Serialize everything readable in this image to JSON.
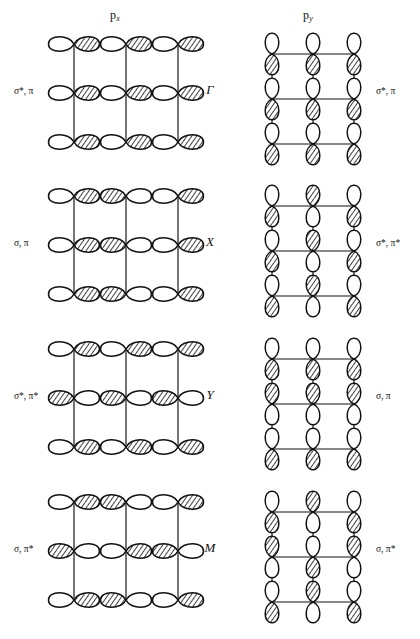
{
  "figure": {
    "headers": {
      "left": {
        "symbol": "p",
        "subscript": "x"
      },
      "right": {
        "symbol": "p",
        "subscript": "y"
      }
    },
    "rows": [
      {
        "kpoint": "Γ",
        "left_label": "σ*, π",
        "right_label": "σ*, π",
        "left_pattern": "uniform",
        "right_pattern": "uniform"
      },
      {
        "kpoint": "X",
        "left_label": "σ, π",
        "right_label": "σ*, π*",
        "left_pattern": "alternate-x",
        "right_pattern": "alternate-x"
      },
      {
        "kpoint": "Y",
        "left_label": "σ*, π*",
        "right_label": "σ, π",
        "left_pattern": "alternate-y",
        "right_pattern": "alternate-y"
      },
      {
        "kpoint": "M",
        "left_label": "σ, π*",
        "right_label": "σ, π*",
        "left_pattern": "alternate-xy",
        "right_pattern": "alternate-xy"
      }
    ],
    "colors": {
      "ink": "#111111",
      "background": "#ffffff",
      "lobe_positive": "#ffffff",
      "lobe_negative": "hatched"
    },
    "geometry": {
      "columns": 3,
      "rows_per_panel": 3
    }
  }
}
